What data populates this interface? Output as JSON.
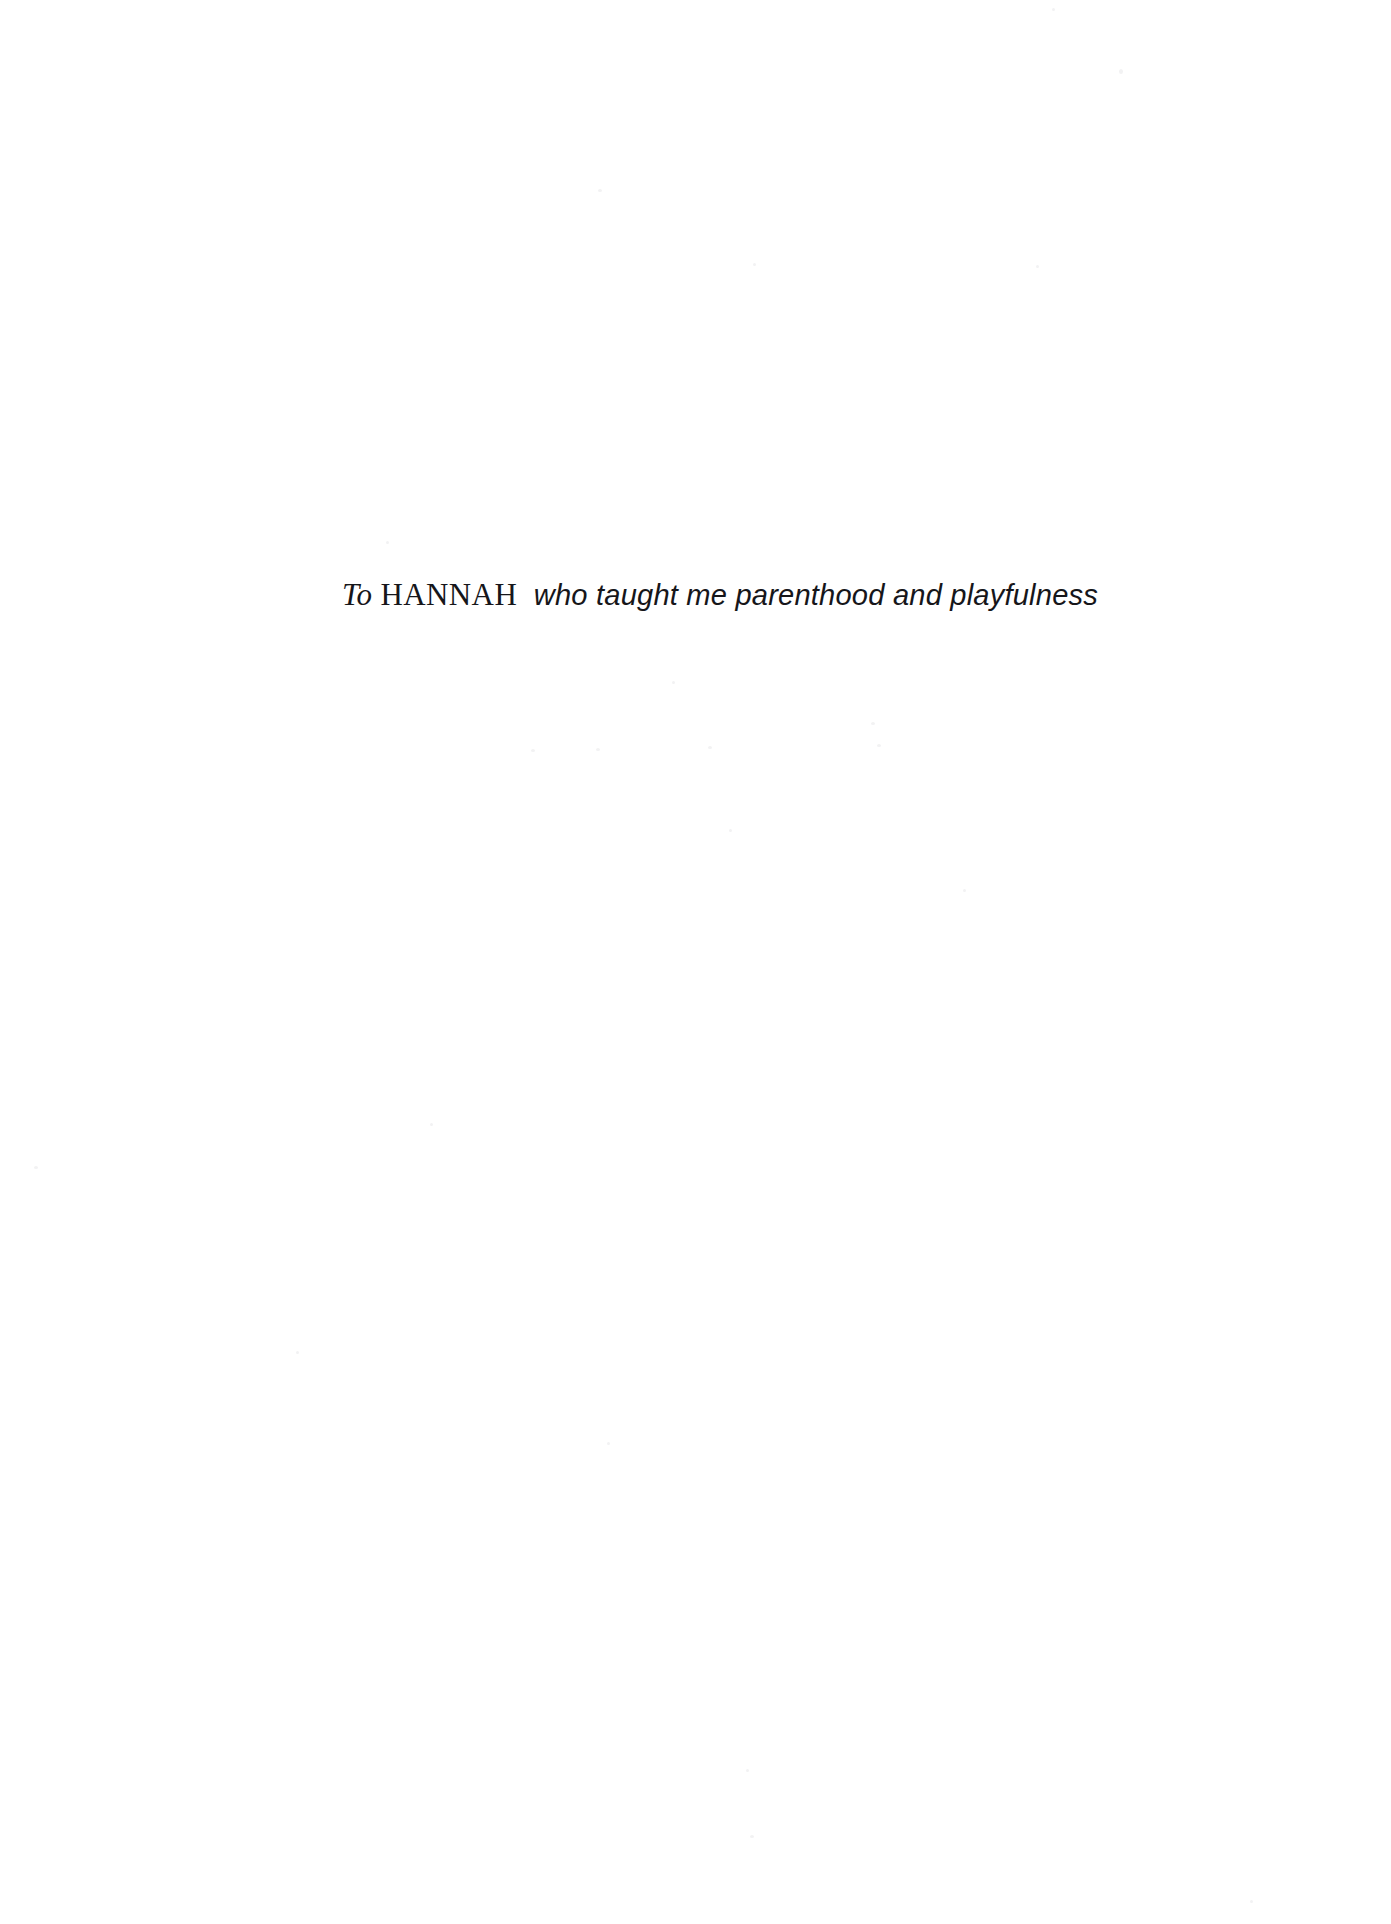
{
  "page": {
    "kind": "book-dedication-page",
    "background_color": "#ffffff",
    "ink_color": "#16161a",
    "width": 1391,
    "height": 1924
  },
  "dedication": {
    "full_text": "To HANNAH who taught me parenthood and playfulness",
    "prefix": "To",
    "name": "HANNAH",
    "phrase": "who taught me parenthood and playfulness",
    "space": " "
  }
}
